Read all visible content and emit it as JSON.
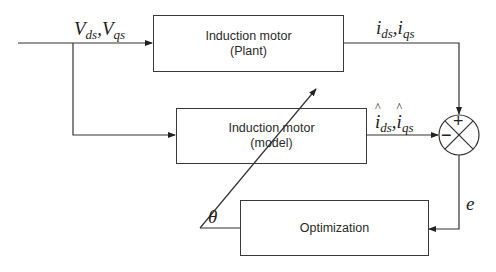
{
  "blocks": {
    "plant": {
      "line1": "Induction motor",
      "line2": "(Plant)"
    },
    "model": {
      "line1": "Induction motor",
      "line2": "(model)"
    },
    "optimization": {
      "label": "Optimization"
    }
  },
  "signals": {
    "input": {
      "v1": "V",
      "v1_sub": "ds",
      "sep": ",",
      "v2": "V",
      "v2_sub": "qs"
    },
    "plant_output": {
      "v1": "i",
      "v1_sub": "ds",
      "sep": ",",
      "v2": "i",
      "v2_sub": "qs"
    },
    "model_output": {
      "v1": "i",
      "v1_sub": "ds",
      "sep": ",",
      "v2": "i",
      "v2_sub": "qs",
      "hat": true
    },
    "error": "e",
    "parameter": "θ"
  },
  "summing_junction": {
    "plus": "+",
    "minus": "−"
  },
  "colors": {
    "line": "#333333",
    "text": "#222222",
    "background": "#ffffff"
  }
}
